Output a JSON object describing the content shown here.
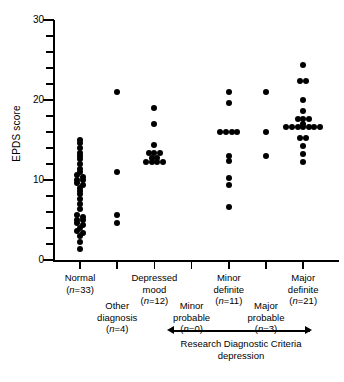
{
  "chart_data": {
    "type": "scatter",
    "title": "",
    "xlabel": "",
    "ylabel": "EPDS score",
    "ylim": [
      0,
      30
    ],
    "ymajor_ticks": [
      0,
      10,
      20,
      30
    ],
    "yminor_step": 2,
    "grid": false,
    "legend": false,
    "annotation": {
      "text_line1": "Research Diagnostic Criteria",
      "text_line2": "depression",
      "spans_categories": [
        "Minor probable",
        "Minor definite",
        "Major probable",
        "Major definite"
      ],
      "style": "double-headed-arrow"
    },
    "categories": [
      {
        "id": "normal",
        "label_line1": "Normal",
        "label_line2": "",
        "n_label": "(n=33)",
        "n": 33,
        "row": "top",
        "values": [
          15,
          14.6,
          14,
          13.4,
          13,
          12.6,
          12,
          11.4,
          11,
          10.6,
          10.4,
          10,
          10,
          9.6,
          9.4,
          9,
          8.6,
          8.2,
          7.6,
          7,
          6.4,
          5.6,
          5.4,
          5,
          5,
          4.6,
          4.4,
          4,
          3.6,
          3.4,
          3,
          2.2,
          1.4
        ]
      },
      {
        "id": "other-diagnosis",
        "label_line1": "Other",
        "label_line2": "diagnosis",
        "n_label": "(n=4)",
        "n": 4,
        "row": "bottom",
        "values": [
          21,
          11,
          5.6,
          4.6
        ]
      },
      {
        "id": "depressed-mood",
        "label_line1": "Depressed",
        "label_line2": "mood",
        "n_label": "(n=12)",
        "n": 12,
        "row": "top",
        "values": [
          19,
          17,
          14.4,
          13.4,
          13.4,
          13.4,
          12.8,
          12.8,
          12.2,
          12.2,
          12.2,
          12.2
        ]
      },
      {
        "id": "minor-probable",
        "label_line1": "Minor",
        "label_line2": "probable",
        "n_label": "(n=0)",
        "n": 0,
        "row": "bottom",
        "values": []
      },
      {
        "id": "minor-definite",
        "label_line1": "Minor",
        "label_line2": "definite",
        "n_label": "(n=11)",
        "n": 11,
        "row": "top",
        "values": [
          21,
          19.6,
          16,
          16,
          16,
          13,
          12.4,
          10.2,
          9.4,
          6.6,
          16
        ]
      },
      {
        "id": "major-probable",
        "label_line1": "Major",
        "label_line2": "probable",
        "n_label": "(n=3)",
        "n": 3,
        "row": "bottom",
        "values": [
          21,
          16,
          13
        ]
      },
      {
        "id": "major-definite",
        "label_line1": "Major",
        "label_line2": "definite",
        "n_label": "(n=21)",
        "n": 21,
        "row": "top",
        "values": [
          24.4,
          22.4,
          22.4,
          20,
          18.6,
          17.6,
          17.6,
          17.6,
          17,
          16.6,
          16.6,
          16.6,
          16.6,
          16.6,
          16.6,
          16.6,
          15.2,
          15.2,
          14.2,
          13.2,
          12.2
        ]
      }
    ]
  }
}
